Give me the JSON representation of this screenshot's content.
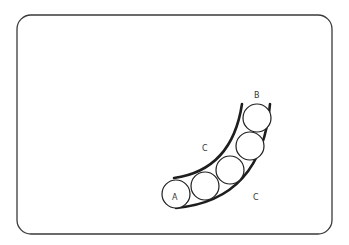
{
  "diagram": {
    "colors": {
      "background": "#ffffff",
      "stroke": "#1e1e1e",
      "label": "#333333"
    },
    "frame": {
      "x": 17,
      "y": 15,
      "width": 315,
      "height": 219,
      "corner_radius": 14
    },
    "channel": {
      "outer_wall_label": "C",
      "inner_wall_label": "C"
    },
    "circles": [
      {
        "id": "A",
        "label": "A",
        "cx": 176,
        "cy": 194,
        "r": 14
      },
      {
        "id": "2",
        "label": "",
        "cx": 205,
        "cy": 186,
        "r": 14
      },
      {
        "id": "3",
        "label": "",
        "cx": 230,
        "cy": 170,
        "r": 14
      },
      {
        "id": "4",
        "label": "",
        "cx": 250,
        "cy": 146,
        "r": 14
      },
      {
        "id": "B",
        "label": "B",
        "cx": 257,
        "cy": 118,
        "r": 14
      }
    ],
    "labels": {
      "A": "A",
      "B": "B",
      "C_upper": "C",
      "C_lower": "C"
    }
  }
}
